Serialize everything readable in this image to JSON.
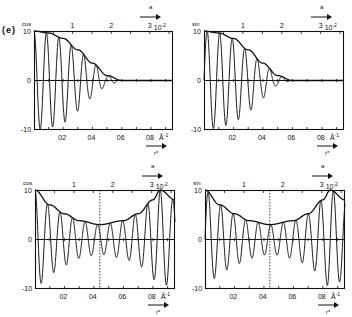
{
  "figure": {
    "panel_label": "(e)",
    "top_axis_arrow_label": "a",
    "bottom_axis_arrow_label": "r*",
    "top_axis_unit": "10",
    "top_axis_unit_exp": "-2",
    "bottom_axis_unit": "Å",
    "bottom_axis_unit_exp": "-1"
  },
  "panels": [
    {
      "id": "top-left",
      "function": "cos",
      "y_ticks": [
        "10",
        "0",
        "-10"
      ],
      "top_ticks": [
        "1",
        "2",
        "3"
      ],
      "bottom_ticks": [
        "0.2",
        "0.4",
        "0.6",
        "0.8"
      ]
    },
    {
      "id": "top-right",
      "function": "sin",
      "y_ticks": [
        "10",
        "0",
        "-10"
      ],
      "top_ticks": [
        "1",
        "2",
        "3"
      ],
      "bottom_ticks": [
        "0.2",
        "0.4",
        "0.6",
        "0.8"
      ]
    },
    {
      "id": "bottom-left",
      "function": "cos",
      "y_ticks": [
        "10",
        "0",
        "-10"
      ],
      "top_ticks": [
        "1",
        "2",
        "3"
      ],
      "bottom_ticks": [
        "0.2",
        "0.4",
        "0.6",
        "0.8"
      ]
    },
    {
      "id": "bottom-right",
      "function": "sin",
      "y_ticks": [
        "10",
        "0",
        "-10"
      ],
      "top_ticks": [
        "1",
        "2",
        "3"
      ],
      "bottom_ticks": [
        "0.2",
        "0.4",
        "0.6",
        "0.8"
      ]
    }
  ],
  "chart_data": [
    {
      "type": "line",
      "title": "(e) cos",
      "function": "cos",
      "xlabel": "r* (Å^-1)",
      "x2label": "a (10^-2)",
      "ylabel": "cos",
      "xlim": [
        0,
        0.95
      ],
      "ylim": [
        -10,
        10
      ],
      "x_ticks": [
        0.2,
        0.4,
        0.6,
        0.8
      ],
      "x2_ticks": [
        1,
        2,
        3
      ],
      "y_ticks": [
        -10,
        0,
        10
      ],
      "series": [
        {
          "name": "envelope",
          "shape": "gaussian decay",
          "x": [
            0,
            0.1,
            0.2,
            0.3,
            0.4,
            0.5,
            0.6
          ],
          "y": [
            10,
            9.6,
            8.5,
            6.2,
            3.5,
            1,
            0
          ]
        },
        {
          "name": "oscillation",
          "shape": "cos oscillation under envelope, decays to 0 near r*=0.6",
          "minima": [
            -10,
            -9.2,
            -8.8,
            -8.4,
            -7.6,
            -6.4
          ]
        }
      ],
      "vertical_marker": null
    },
    {
      "type": "line",
      "title": "sin",
      "function": "sin",
      "xlabel": "r* (Å^-1)",
      "x2label": "a (10^-2)",
      "ylabel": "sin",
      "xlim": [
        0,
        0.95
      ],
      "ylim": [
        -10,
        10
      ],
      "x_ticks": [
        0.2,
        0.4,
        0.6,
        0.8
      ],
      "x2_ticks": [
        1,
        2,
        3
      ],
      "y_ticks": [
        -10,
        0,
        10
      ],
      "series": [
        {
          "name": "envelope",
          "shape": "gaussian decay",
          "x": [
            0,
            0.1,
            0.2,
            0.3,
            0.4,
            0.5,
            0.6
          ],
          "y": [
            10,
            9.6,
            8.5,
            6.2,
            3.5,
            1,
            0
          ]
        },
        {
          "name": "oscillation",
          "shape": "sin oscillation under envelope, broad dip ~-4 at r*~0.43",
          "minima": [
            -10,
            -9.4,
            -9,
            -8.6,
            -7.8,
            -6.6,
            -4
          ]
        }
      ],
      "vertical_marker": null
    },
    {
      "type": "line",
      "title": "cos",
      "function": "cos",
      "xlabel": "r* (Å^-1)",
      "x2label": "a (10^-2)",
      "ylabel": "cos",
      "xlim": [
        0,
        0.95
      ],
      "ylim": [
        -10,
        10
      ],
      "x_ticks": [
        0.2,
        0.4,
        0.6,
        0.8
      ],
      "x2_ticks": [
        1,
        2,
        3
      ],
      "y_ticks": [
        -10,
        0,
        10
      ],
      "series": [
        {
          "name": "envelope",
          "shape": "U-shaped, min ~3 at r*~0.44, max 10 at r*=0 and r*~0.85",
          "x": [
            0,
            0.1,
            0.2,
            0.3,
            0.44,
            0.6,
            0.7,
            0.8,
            0.85,
            0.95
          ],
          "y": [
            10,
            7,
            5.2,
            3.8,
            3,
            3.8,
            5.2,
            8,
            10,
            8
          ]
        },
        {
          "name": "oscillation",
          "shape": "cos oscillation under U-shaped envelope"
        }
      ],
      "vertical_marker": {
        "x": 0.44,
        "style": "dotted"
      }
    },
    {
      "type": "line",
      "title": "sin",
      "function": "sin",
      "xlabel": "r* (Å^-1)",
      "x2label": "a (10^-2)",
      "ylabel": "sin",
      "xlim": [
        0,
        0.95
      ],
      "ylim": [
        -10,
        10
      ],
      "x_ticks": [
        0.2,
        0.4,
        0.6,
        0.8
      ],
      "x2_ticks": [
        1,
        2,
        3
      ],
      "y_ticks": [
        -10,
        0,
        10
      ],
      "series": [
        {
          "name": "envelope",
          "shape": "U-shaped, min ~3 at r*~0.44, max 10 at r*=0 and r*~0.85",
          "x": [
            0,
            0.1,
            0.2,
            0.3,
            0.44,
            0.6,
            0.7,
            0.8,
            0.85,
            0.95
          ],
          "y": [
            10,
            7,
            5.2,
            3.8,
            3,
            3.8,
            5.2,
            8,
            10,
            8
          ]
        },
        {
          "name": "oscillation",
          "shape": "sin oscillation under U-shaped envelope"
        }
      ],
      "vertical_marker": {
        "x": 0.44,
        "style": "dotted"
      }
    }
  ]
}
